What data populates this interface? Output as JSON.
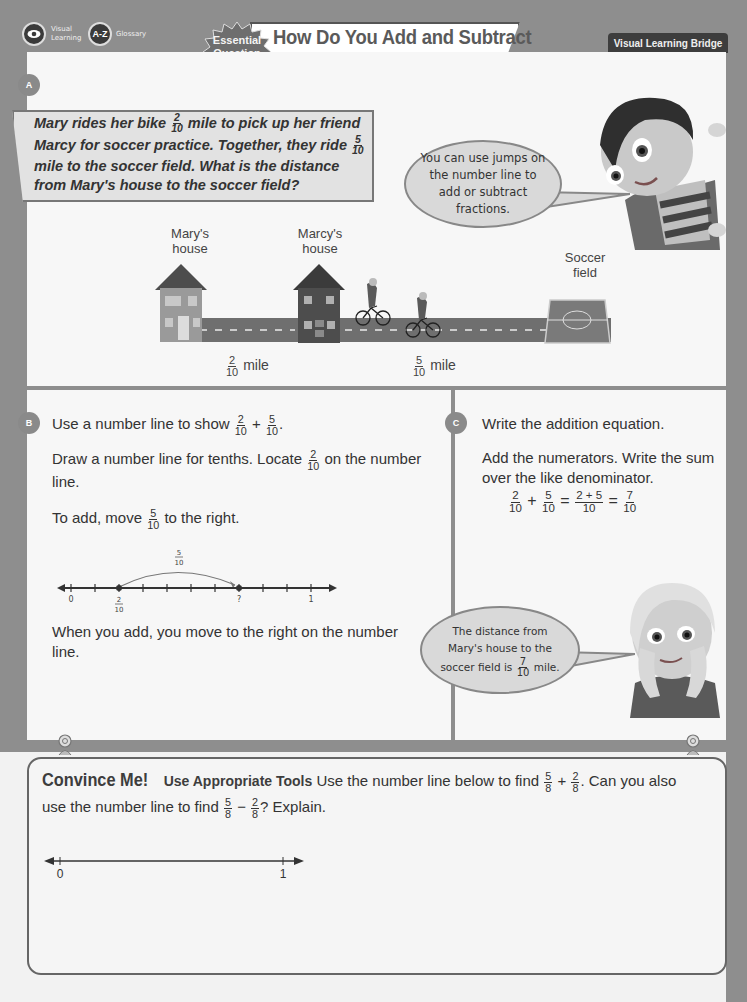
{
  "header": {
    "visual_learning_label_line1": "Visual",
    "visual_learning_label_line2": "Learning",
    "glossary_icon_text": "A-Z",
    "glossary_label": "Glossary",
    "essential_line1": "Essential",
    "essential_line2": "Question",
    "title_line1": "How Do You Add and Subtract",
    "title_line2": "Fractions on a Number Line?",
    "tab_label": "Visual Learning Bridge"
  },
  "panel_a": {
    "letter": "A",
    "problem": {
      "p1": "Mary rides her bike",
      "f1_num": "2",
      "f1_den": "10",
      "p2": "mile to pick up her friend Marcy for soccer practice. Together, they ride",
      "f2_num": "5",
      "f2_den": "10",
      "p3": "mile to the soccer field. What is the distance from Mary's house to the soccer field?"
    },
    "bubble": "You can use jumps on the number line to add or subtract fractions.",
    "scene": {
      "marys_house_line1": "Mary's",
      "marys_house_line2": "house",
      "marcys_house_line1": "Marcy's",
      "marcys_house_line2": "house",
      "soccer_line1": "Soccer",
      "soccer_line2": "field",
      "dist1_num": "2",
      "dist1_den": "10",
      "dist1_unit": "mile",
      "dist2_num": "5",
      "dist2_den": "10",
      "dist2_unit": "mile"
    }
  },
  "panel_b": {
    "letter": "B",
    "line1_pre": "Use a number line to show",
    "line1_f1_num": "2",
    "line1_f1_den": "10",
    "line1_op": "+",
    "line1_f2_num": "5",
    "line1_f2_den": "10",
    "line1_end": ".",
    "line2_pre": "Draw a number line for tenths. Locate",
    "line2_f_num": "2",
    "line2_f_den": "10",
    "line2_post": "on the number line.",
    "line3_pre": "To add, move",
    "line3_f_num": "5",
    "line3_f_den": "10",
    "line3_post": "to the right.",
    "numberline": {
      "jump_num": "5",
      "jump_den": "10",
      "label_zero": "0",
      "label_start_num": "2",
      "label_start_den": "10",
      "label_unknown": "?",
      "label_one": "1"
    },
    "line4": "When you add, you move to the right on the number line."
  },
  "panel_c": {
    "letter": "C",
    "line1": "Write the addition equation.",
    "line2": "Add the numerators. Write the sum over the like denominator.",
    "equation": {
      "a_num": "2",
      "a_den": "10",
      "plus": "+",
      "b_num": "5",
      "b_den": "10",
      "eq": "=",
      "c_num": "2 + 5",
      "c_den": "10",
      "eq2": "=",
      "d_num": "7",
      "d_den": "10"
    },
    "bubble_line1": "The distance from",
    "bubble_line2": "Mary's house to the",
    "bubble_line3_pre": "soccer field is",
    "bubble_f_num": "7",
    "bubble_f_den": "10",
    "bubble_line3_post": "mile."
  },
  "convince": {
    "title": "Convince Me!",
    "practice": "Use Appropriate Tools",
    "text1": "Use the number line below to find",
    "f1_num": "5",
    "f1_den": "8",
    "op1": "+",
    "f2_num": "2",
    "f2_den": "8",
    "text2": ". Can you also use the number line to find",
    "f3_num": "5",
    "f3_den": "8",
    "op2": "−",
    "f4_num": "2",
    "f4_den": "8",
    "text3": "? Explain.",
    "numberline": {
      "label_zero": "0",
      "label_one": "1"
    }
  },
  "colors": {
    "band": "#8e8e8e",
    "panel": "#f7f7f7",
    "dark": "#3d3d3d",
    "bubble": "#d9d9d9"
  }
}
